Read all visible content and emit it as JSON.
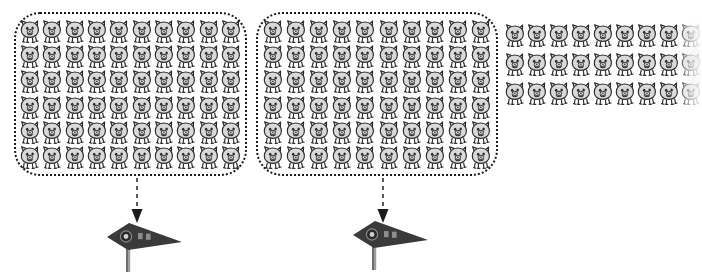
{
  "illustration": {
    "title": "Grouped counting illustration",
    "description": "Two dotted groups of pig icons, each with a dashed arrow pointing down to a pennant flag marker, followed by an ungrouped remainder of pig icons at the right",
    "background_color": "#ffffff",
    "icon_name": "pig-icon",
    "icon_outline_color": "#2b2b2b",
    "icon_fill_color": "#d9d9d9"
  },
  "groups": [
    {
      "id": "group-1",
      "border_style": "dotted",
      "border_color": "#1b1b1b",
      "rows": 6,
      "columns": 10,
      "count": 60,
      "x": 14,
      "y": 12,
      "width": 233,
      "height": 164
    },
    {
      "id": "group-2",
      "border_style": "dotted",
      "border_color": "#1b1b1b",
      "rows": 6,
      "columns": 10,
      "count": 60,
      "x": 256,
      "y": 12,
      "width": 242,
      "height": 164
    }
  ],
  "remainder": {
    "id": "remainder-group",
    "border_style": "none",
    "rows": 3,
    "columns": 9,
    "count": 27,
    "x": 504,
    "y": 20,
    "width": 198,
    "height": 88
  },
  "arrows": [
    {
      "id": "arrow-1",
      "style": "dashed",
      "direction": "down",
      "color": "#1b1b1b",
      "x": 130,
      "y": 178
    },
    {
      "id": "arrow-2",
      "style": "dashed",
      "direction": "down",
      "color": "#1b1b1b",
      "x": 376,
      "y": 178
    }
  ],
  "flags": [
    {
      "id": "flag-1",
      "shape": "pennant",
      "fill_color": "#3a3a3a",
      "pole_color": "#6e6e6e",
      "badge_icon": "circle-badge-icon",
      "label": "方块",
      "x": 102,
      "y": 220
    },
    {
      "id": "flag-2",
      "shape": "pennant",
      "fill_color": "#3a3a3a",
      "pole_color": "#6e6e6e",
      "badge_icon": "circle-badge-icon",
      "label": "方块",
      "x": 348,
      "y": 218
    }
  ]
}
